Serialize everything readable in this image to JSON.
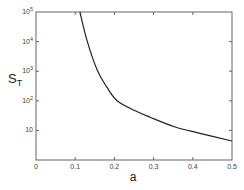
{
  "chart_data": {
    "type": "line",
    "title": "",
    "xlabel": "a",
    "ylabel": "S_T",
    "ylabel_main": "S",
    "ylabel_sub": "T",
    "xlim": [
      0,
      0.5
    ],
    "ylim": [
      1,
      100000
    ],
    "yscale": "log",
    "grid": false,
    "legend": null,
    "x_ticks": [
      0,
      0.1,
      0.2,
      0.3,
      0.4,
      0.5
    ],
    "x_tick_labels": [
      "0",
      "0.1",
      "0.2",
      "0.3",
      "0.4",
      "0.5"
    ],
    "y_ticks": [
      10,
      100,
      1000,
      10000,
      100000
    ],
    "y_tick_labels": [
      {
        "base": "10",
        "exp": ""
      },
      {
        "base": "10",
        "exp": "2"
      },
      {
        "base": "10",
        "exp": "3"
      },
      {
        "base": "10",
        "exp": "4"
      },
      {
        "base": "10",
        "exp": "5"
      }
    ],
    "series": [
      {
        "name": "S_T",
        "x": [
          0.112,
          0.13,
          0.156,
          0.18,
          0.207,
          0.253,
          0.291,
          0.355,
          0.418,
          0.5
        ],
        "y": [
          100000,
          11000,
          1100,
          300,
          100,
          46,
          28,
          13,
          8,
          4.4
        ]
      }
    ]
  }
}
